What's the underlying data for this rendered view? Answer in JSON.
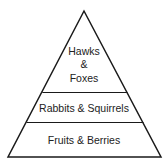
{
  "diagram": {
    "type": "food-pyramid",
    "levels": [
      {
        "label_lines": [
          "Hawks",
          "&",
          "Foxes"
        ],
        "position": "top"
      },
      {
        "label": "Rabbits & Squirrels",
        "position": "middle"
      },
      {
        "label": "Fruits & Berries",
        "position": "bottom"
      }
    ],
    "stroke_color": "#1a1a1a",
    "background": "#ffffff"
  }
}
